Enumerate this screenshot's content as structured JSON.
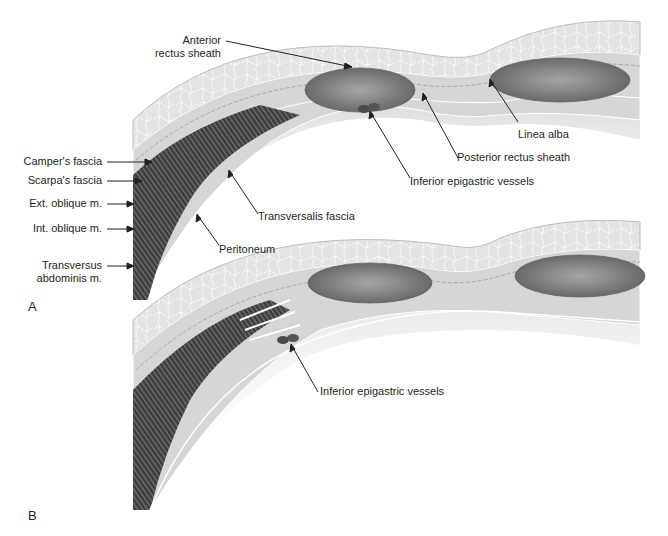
{
  "figure": {
    "panels": [
      {
        "id": "A",
        "letter": "A",
        "labels": {
          "anterior_rectus_sheath_1": "Anterior",
          "anterior_rectus_sheath_2": "rectus sheath",
          "campers_fascia": "Camper's fascia",
          "scarpas_fascia": "Scarpa's fascia",
          "ext_oblique": "Ext. oblique m.",
          "int_oblique": "Int. oblique m.",
          "transversus_1": "Transversus",
          "transversus_2": "abdominis m.",
          "linea_alba": "Linea alba",
          "posterior_rectus_sheath": "Posterior rectus sheath",
          "inferior_epigastric_vessels": "Inferior epigastric vessels",
          "transversalis_fascia": "Transversalis fascia",
          "peritoneum": "Peritoneum"
        }
      },
      {
        "id": "B",
        "letter": "B",
        "labels": {
          "inferior_epigastric_vessels": "Inferior epigastric vessels"
        }
      }
    ],
    "colors": {
      "fat": "#e6e6e6",
      "fascia": "#d4d4d4",
      "muscle_dark": "#3a3a3a",
      "rectus": "#8c8c8c",
      "vessel": "#4a4a4a",
      "text": "#231f20"
    }
  }
}
